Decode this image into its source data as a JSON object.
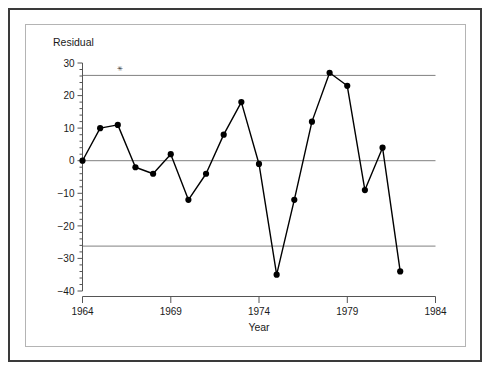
{
  "chart_data": {
    "type": "line",
    "title": "",
    "xlabel": "Year",
    "ylabel": "Residual",
    "ylabel_position": "top-left",
    "x": [
      1964,
      1965,
      1966,
      1967,
      1968,
      1969,
      1970,
      1971,
      1972,
      1973,
      1974,
      1975,
      1976,
      1977,
      1978,
      1979,
      1980,
      1981,
      1982
    ],
    "values": [
      0,
      10,
      11,
      -2,
      -4,
      2,
      -12,
      -4,
      8,
      18,
      -1,
      -35,
      -12,
      12,
      27,
      23,
      -9,
      4,
      -34
    ],
    "series": [
      {
        "name": "Residual",
        "values": [
          0,
          10,
          11,
          -2,
          -4,
          2,
          -12,
          -4,
          8,
          18,
          -1,
          -35,
          -12,
          12,
          27,
          23,
          -9,
          4,
          -34
        ]
      }
    ],
    "xlim": [
      1964,
      1984
    ],
    "ylim": [
      -40,
      30
    ],
    "x_major_ticks": [
      1964,
      1969,
      1974,
      1979,
      1984
    ],
    "x_major_tick_labels": [
      "1964",
      "1969",
      "1974",
      "1979",
      "1984"
    ],
    "y_major_ticks": [
      30,
      20,
      10,
      0,
      -10,
      -20,
      -30,
      -40
    ],
    "y_major_tick_labels": [
      "30",
      "20",
      "10",
      "0",
      "−10",
      "−20",
      "−30",
      "−40"
    ],
    "y_minor_tick_step": 2,
    "grid": false,
    "reference_lines": [
      {
        "name": "upper-control-limit",
        "value": 26.2
      },
      {
        "name": "center-line",
        "value": 0
      },
      {
        "name": "lower-control-limit",
        "value": -26.2
      }
    ],
    "annotations": [
      {
        "name": "asterisk-marker",
        "symbol": "✳",
        "x": 1966.1,
        "y": 28.2
      }
    ],
    "legend": null,
    "marker": "filled-circle",
    "line_color": "#000000",
    "marker_color": "#000000",
    "reference_line_color": "#808080",
    "axis_color": "#555555",
    "background_color": "#ffffff"
  },
  "frame": {
    "outer_border_color": "#3a3a3a",
    "inner_border_color": "#b4b4b4"
  }
}
